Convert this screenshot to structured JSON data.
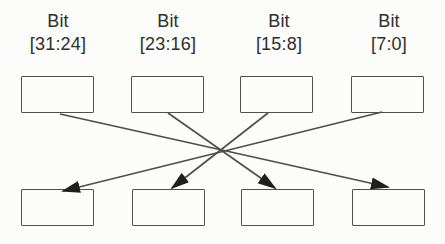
{
  "diagram": {
    "columns": [
      {
        "label_line1": "Bit",
        "label_line2": "[31:24]"
      },
      {
        "label_line1": "Bit",
        "label_line2": "[23:16]"
      },
      {
        "label_line1": "Bit",
        "label_line2": "[15:8]"
      },
      {
        "label_line1": "Bit",
        "label_line2": "[7:0]"
      }
    ],
    "top_boxes": [
      {
        "value": ""
      },
      {
        "value": ""
      },
      {
        "value": ""
      },
      {
        "value": ""
      }
    ],
    "bottom_boxes": [
      {
        "value": ""
      },
      {
        "value": ""
      },
      {
        "value": ""
      },
      {
        "value": ""
      }
    ],
    "connections": [
      {
        "from": "top-box-1",
        "to": "bottom-box-4"
      },
      {
        "from": "top-box-2",
        "to": "bottom-box-3"
      },
      {
        "from": "top-box-3",
        "to": "bottom-box-2"
      },
      {
        "from": "top-box-4",
        "to": "bottom-box-1"
      }
    ],
    "colors": {
      "background": "#fcfcfa",
      "box_border": "#4f4f4f",
      "line": "#4d4d4d",
      "arrowhead": "#1f1f1f",
      "text": "#2e2e2e"
    }
  }
}
